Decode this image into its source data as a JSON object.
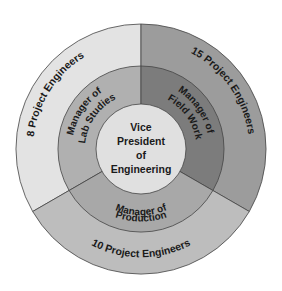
{
  "diagram": {
    "center": {
      "lines": [
        "Vice",
        "President",
        "of",
        "Engineering"
      ],
      "color": "#e0e0e0"
    },
    "middle_ring": [
      {
        "lines": [
          "Manager of",
          "Lab Studies"
        ],
        "color": "#b0b0b0"
      },
      {
        "lines": [
          "Manager of",
          "Field Work"
        ],
        "color": "#7c7c7c"
      },
      {
        "lines": [
          "Manager of",
          "Production"
        ],
        "color": "#a8a8a8"
      }
    ],
    "outer_ring": [
      {
        "label": "8 Project Engineers",
        "color": "#e3e3e3"
      },
      {
        "label": "15 Project Engineers",
        "color": "#9c9c9c"
      },
      {
        "label": "10 Project Engineers",
        "color": "#bdbdbd"
      }
    ],
    "stroke_color": "#444444"
  }
}
